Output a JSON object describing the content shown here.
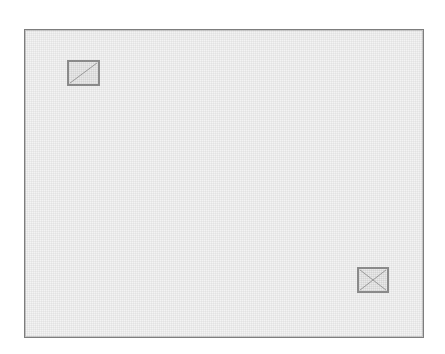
{
  "canvas": {
    "width": 445,
    "height": 354,
    "background_color": "#ffffff",
    "title": "Technical drawing sheet"
  },
  "frame": {
    "name": "drawing-frame",
    "x": 24,
    "y": 29,
    "width": 400,
    "height": 309,
    "border_color": "#7d7d7d",
    "fill_color": "#f3f3f3",
    "texture": "halftone-dither"
  },
  "markers": [
    {
      "id": "box-top-left",
      "label": "crossed-box-marker",
      "icon": "diagonal-slash-box-icon",
      "x": 66,
      "y": 59,
      "width": 33,
      "height": 26,
      "border_color": "#8a8a8a",
      "fill_color": "#eaeaea",
      "diagonals": "single-ascending",
      "position_description": "upper-left"
    },
    {
      "id": "box-bottom-right",
      "label": "crossed-box-marker",
      "icon": "x-cross-box-icon",
      "x": 356,
      "y": 266,
      "width": 32,
      "height": 26,
      "border_color": "#8a8a8a",
      "fill_color": "#eaeaea",
      "diagonals": "both",
      "position_description": "lower-right"
    }
  ],
  "chart_data": {
    "type": "scatter",
    "title": "",
    "xlabel": "",
    "ylabel": "",
    "xlim": [
      24,
      424
    ],
    "ylim": [
      29,
      338
    ],
    "grid": false,
    "legend": "none",
    "points": [
      {
        "label": "upper-left marker",
        "x": 82,
        "y": 72,
        "marker": "diagonal-slash-box"
      },
      {
        "label": "lower-right marker",
        "x": 372,
        "y": 279,
        "marker": "x-cross-box"
      }
    ]
  }
}
